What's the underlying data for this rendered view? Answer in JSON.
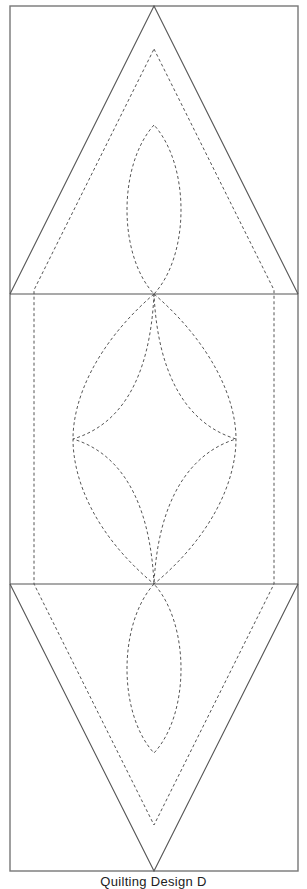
{
  "diagram": {
    "title": "Quilting Design D",
    "colors": {
      "line": "#555555",
      "frame": "#777777",
      "background": "#ffffff"
    },
    "frame": {
      "x": 10,
      "y": 6,
      "width": 288,
      "height": 865
    },
    "sections": [
      {
        "name": "top-triangle-block",
        "y_top": 6,
        "y_bottom": 294
      },
      {
        "name": "center-square-block",
        "y_top": 294,
        "y_bottom": 584
      },
      {
        "name": "bottom-triangle-block",
        "y_top": 584,
        "y_bottom": 871
      }
    ],
    "elements": [
      "outer frame (solid)",
      "top triangle (solid)",
      "bottom inverted triangle (solid)",
      "inner dashed outline (triangle-rectangle-triangle)",
      "top lens (dashed)",
      "center large lens (dashed)",
      "center four-point star (dashed)",
      "bottom lens (dashed)"
    ]
  }
}
